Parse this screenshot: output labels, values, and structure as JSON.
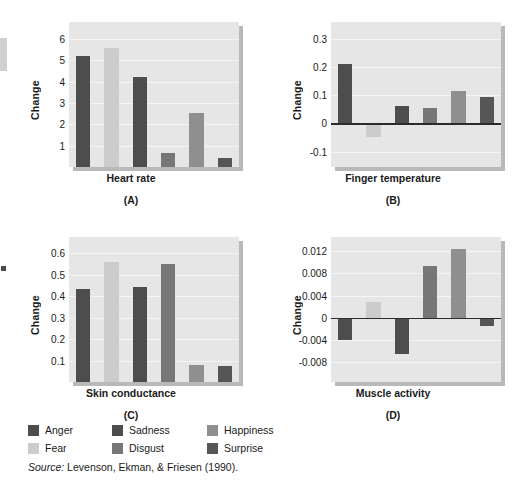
{
  "figure": {
    "y_axis_title": "Change",
    "source_prefix": "Source:",
    "source_text": "Levenson, Ekman, & Friesen (1990)."
  },
  "legend": {
    "rows": [
      [
        {
          "label": "Anger",
          "color": "#4d4d4d"
        },
        {
          "label": "Sadness",
          "color": "#4d4d4d"
        },
        {
          "label": "Happiness",
          "color": "#8f8f8f"
        }
      ],
      [
        {
          "label": "Fear",
          "color": "#cccccc"
        },
        {
          "label": "Disgust",
          "color": "#777777"
        },
        {
          "label": "Surprise",
          "color": "#565656"
        }
      ]
    ]
  },
  "series_colors": {
    "Anger": "#4d4d4d",
    "Fear": "#cccccc",
    "Sadness": "#4d4d4d",
    "Disgust": "#777777",
    "Happiness": "#8f8f8f",
    "Surprise": "#565656"
  },
  "chart_data": [
    {
      "type": "bar",
      "panel": "A",
      "panel_letter": "(A)",
      "title": "Heart rate",
      "xlabel": "Heart rate",
      "ylabel": "Change",
      "categories": [
        "Anger",
        "Fear",
        "Sadness",
        "Disgust",
        "Happiness",
        "Surprise"
      ],
      "values": [
        5.2,
        5.6,
        4.2,
        0.65,
        2.55,
        0.4
      ],
      "ticks": [
        6,
        5,
        4,
        3,
        2,
        1
      ],
      "tick_labels": [
        "6",
        "5",
        "4",
        "3",
        "2",
        "1"
      ],
      "ylim": [
        0,
        6.8
      ],
      "grid": true,
      "zero_line": false
    },
    {
      "type": "bar",
      "panel": "B",
      "panel_letter": "(B)",
      "title": "Finger temperature",
      "xlabel": "Finger temperature",
      "ylabel": "Change",
      "categories": [
        "Anger",
        "Fear",
        "Sadness",
        "Disgust",
        "Happiness",
        "Surprise"
      ],
      "values": [
        0.21,
        -0.05,
        0.06,
        0.055,
        0.115,
        0.095
      ],
      "ticks": [
        0.3,
        0.2,
        0.1,
        0,
        -0.1
      ],
      "tick_labels": [
        "0.3",
        "0.2",
        "0.1",
        "0",
        "-0.1"
      ],
      "ylim": [
        -0.155,
        0.36
      ],
      "grid": true,
      "zero_line": true
    },
    {
      "type": "bar",
      "panel": "C",
      "panel_letter": "(C)",
      "title": "Skin conductance",
      "xlabel": "Skin conductance",
      "ylabel": "Change",
      "categories": [
        "Anger",
        "Fear",
        "Sadness",
        "Disgust",
        "Happiness",
        "Surprise"
      ],
      "values": [
        0.435,
        0.56,
        0.44,
        0.55,
        0.08,
        0.075
      ],
      "ticks": [
        0.6,
        0.5,
        0.4,
        0.3,
        0.2,
        0.1
      ],
      "tick_labels": [
        "0.6",
        "0.5",
        "0.4",
        "0.3",
        "0.2",
        "0.1"
      ],
      "ylim": [
        0,
        0.675
      ],
      "grid": true,
      "zero_line": false
    },
    {
      "type": "bar",
      "panel": "D",
      "panel_letter": "(D)",
      "title": "Muscle activity",
      "xlabel": "Muscle activity",
      "ylabel": "Change",
      "categories": [
        "Anger",
        "Fear",
        "Sadness",
        "Disgust",
        "Happiness",
        "Surprise"
      ],
      "values": [
        -0.004,
        0.0028,
        -0.0065,
        0.0093,
        0.0123,
        -0.0015
      ],
      "ticks": [
        0.012,
        0.008,
        0.004,
        0,
        -0.004,
        -0.008
      ],
      "tick_labels": [
        "0.012",
        "0.008",
        "0.004",
        "0",
        "-0.004",
        "-0.008"
      ],
      "ylim": [
        -0.0115,
        0.0145
      ],
      "grid": true,
      "zero_line": true
    }
  ]
}
